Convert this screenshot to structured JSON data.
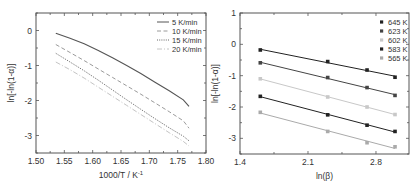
{
  "chart_data": [
    {
      "type": "line",
      "panel": "left",
      "title": "",
      "xlabel": "1000/T / K",
      "xlabel_superscript": "-1",
      "ylabel": "ln[-ln(1-α)]",
      "xlim": [
        1.5,
        1.8
      ],
      "ylim": [
        -3.5,
        0.5
      ],
      "xticks": [
        1.5,
        1.55,
        1.6,
        1.65,
        1.7,
        1.75,
        1.8
      ],
      "xtick_labels": [
        "1.50",
        "1.55",
        "1.60",
        "1.65",
        "1.70",
        "1.75",
        "1.80"
      ],
      "yticks": [
        0,
        -1,
        -2,
        -3
      ],
      "ytick_labels": [
        "0",
        "-1",
        "-2",
        "-3"
      ],
      "grid": false,
      "legend_position": "upper right",
      "x": [
        1.535,
        1.56,
        1.585,
        1.61,
        1.635,
        1.66,
        1.685,
        1.71,
        1.735,
        1.76,
        1.77
      ],
      "series": [
        {
          "name": "5 K/min",
          "style": "solid",
          "color": "#555555",
          "values": [
            -0.08,
            -0.22,
            -0.38,
            -0.57,
            -0.78,
            -1.0,
            -1.23,
            -1.48,
            -1.72,
            -1.98,
            -2.17
          ]
        },
        {
          "name": "10 K/min",
          "style": "dashed",
          "color": "#9a9a9a",
          "values": [
            -0.4,
            -0.63,
            -0.86,
            -1.1,
            -1.34,
            -1.58,
            -1.82,
            -2.07,
            -2.32,
            -2.58,
            -2.79
          ]
        },
        {
          "name": "15 K/min",
          "style": "dotted",
          "color": "#666666",
          "values": [
            -0.65,
            -0.9,
            -1.15,
            -1.42,
            -1.7,
            -1.98,
            -2.25,
            -2.52,
            -2.78,
            -3.02,
            -3.15
          ]
        },
        {
          "name": "20 K/min",
          "style": "dashdot",
          "color": "#c4c4c4",
          "values": [
            -0.9,
            -1.12,
            -1.36,
            -1.62,
            -1.88,
            -2.14,
            -2.4,
            -2.66,
            -2.92,
            -3.17,
            -3.3
          ]
        }
      ]
    },
    {
      "type": "scatter",
      "panel": "right",
      "title": "",
      "xlabel": "ln(β)",
      "ylabel": "ln[-ln(1-α)]",
      "xlim": [
        1.4,
        3.14
      ],
      "ylim": [
        -3.5,
        1
      ],
      "xticks": [
        1.4,
        2.1,
        2.8
      ],
      "xtick_labels": [
        "1.4",
        "2.1",
        "2.8"
      ],
      "yticks": [
        1,
        0,
        -1,
        -2,
        -3
      ],
      "ytick_labels": [
        "1",
        "0",
        "-1",
        "-2",
        "-3"
      ],
      "grid": false,
      "legend_position": "upper right",
      "fit_lines": true,
      "x": [
        1.609,
        2.303,
        2.708,
        2.996
      ],
      "series": [
        {
          "name": "645 K",
          "color": "#222222",
          "values": [
            -0.18,
            -0.55,
            -0.82,
            -1.05
          ]
        },
        {
          "name": "623 K",
          "color": "#444444",
          "values": [
            -0.59,
            -1.06,
            -1.38,
            -1.63
          ]
        },
        {
          "name": "602 K",
          "color": "#c8c8c8",
          "values": [
            -1.1,
            -1.68,
            -2.0,
            -2.24
          ]
        },
        {
          "name": "583 K",
          "color": "#222222",
          "values": [
            -1.66,
            -2.25,
            -2.58,
            -2.78
          ]
        },
        {
          "name": "565 K",
          "color": "#aaaaaa",
          "values": [
            -2.17,
            -2.78,
            -3.14,
            -3.27
          ]
        }
      ]
    }
  ]
}
